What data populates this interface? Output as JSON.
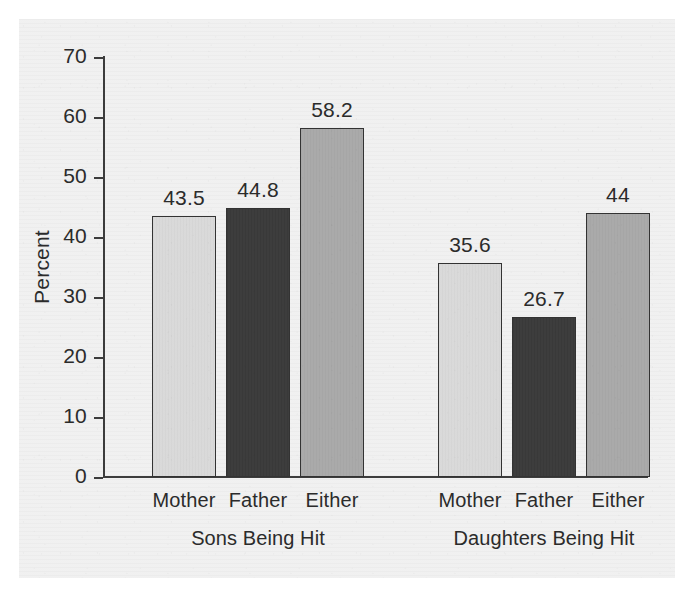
{
  "chart_data": {
    "type": "bar",
    "title": "",
    "xlabel": "",
    "ylabel": "Percent",
    "ylim": [
      0,
      70
    ],
    "yticks": [
      0,
      10,
      20,
      30,
      40,
      50,
      60,
      70
    ],
    "ytick_labels": [
      "0",
      "10",
      "20",
      "30",
      "40",
      "50",
      "60",
      "70"
    ],
    "grid": false,
    "legend": "none",
    "groups": [
      "Sons Being Hit",
      "Daughters Being Hit"
    ],
    "categories": [
      "Mother",
      "Father",
      "Either"
    ],
    "series": [
      {
        "name": "Sons Being Hit",
        "values": [
          43.5,
          44.8,
          58.2
        ],
        "labels": [
          "43.5",
          "44.8",
          "58.2"
        ]
      },
      {
        "name": "Daughters Being Hit",
        "values": [
          35.6,
          26.7,
          44
        ],
        "labels": [
          "35.6",
          "26.7",
          "44"
        ]
      }
    ],
    "bars": [
      {
        "group": "Sons Being Hit",
        "category": "Mother",
        "value": 43.5,
        "label": "43.5",
        "color": "#d9d9d9"
      },
      {
        "group": "Sons Being Hit",
        "category": "Father",
        "value": 44.8,
        "label": "44.8",
        "color": "#3a3a3a"
      },
      {
        "group": "Sons Being Hit",
        "category": "Either",
        "value": 58.2,
        "label": "58.2",
        "color": "#a9a9a9"
      },
      {
        "group": "Daughters Being Hit",
        "category": "Mother",
        "value": 35.6,
        "label": "35.6",
        "color": "#d9d9d9"
      },
      {
        "group": "Daughters Being Hit",
        "category": "Father",
        "value": 26.7,
        "label": "26.7",
        "color": "#3a3a3a"
      },
      {
        "group": "Daughters Being Hit",
        "category": "Either",
        "value": 44,
        "label": "44",
        "color": "#a9a9a9"
      }
    ],
    "colors": {
      "mother": "#d9d9d9",
      "father": "#3a3a3a",
      "either": "#a9a9a9",
      "bar_outline": "#333333",
      "axis": "#3c3c3c",
      "text": "#2b2b2b",
      "panel": "#efefef",
      "page": "#ffffff"
    }
  }
}
